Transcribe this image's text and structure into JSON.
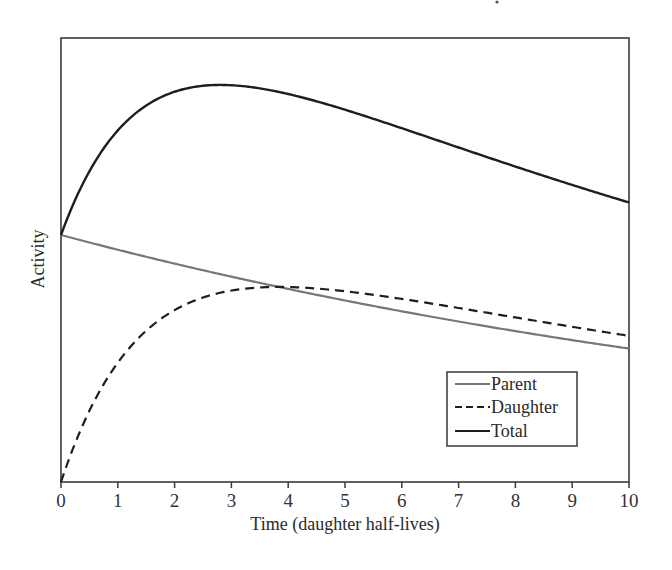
{
  "chart_data": {
    "type": "line",
    "title": "",
    "xlabel": "Time (daughter half-lives)",
    "ylabel": "Activity",
    "x": [
      0,
      1,
      2,
      3,
      4,
      5,
      6,
      7,
      8,
      9,
      10
    ],
    "xticks": [
      "0",
      "1",
      "2",
      "3",
      "4",
      "5",
      "6",
      "7",
      "8",
      "9",
      "10"
    ],
    "xlim": [
      0,
      10
    ],
    "ylim": [
      0,
      1.8
    ],
    "yticks": [],
    "grid": false,
    "legend_position": "lower right (inside)",
    "series": [
      {
        "name": "Parent",
        "style": "solid",
        "color": "#777777",
        "values": [
          1.0,
          0.94,
          0.884,
          0.831,
          0.782,
          0.735,
          0.691,
          0.65,
          0.611,
          0.574,
          0.54
        ]
      },
      {
        "name": "Daughter",
        "style": "dashed",
        "color": "#1e1e1e",
        "values": [
          0.0,
          0.483,
          0.696,
          0.775,
          0.79,
          0.773,
          0.742,
          0.705,
          0.667,
          0.63,
          0.593
        ]
      },
      {
        "name": "Total",
        "style": "solid",
        "color": "#1e1e1e",
        "values": [
          1.0,
          1.423,
          1.58,
          1.606,
          1.572,
          1.508,
          1.433,
          1.355,
          1.278,
          1.204,
          1.133
        ]
      }
    ],
    "annotations": [
      {
        "text": "Daughter activity crosses parent activity",
        "x": 3.7
      },
      {
        "text": "Total activity maximum",
        "x": 2.7
      }
    ],
    "model": {
      "parent_decay_const": 0.0616,
      "daughter_decay_const": 0.6931
    }
  },
  "legend": {
    "items": [
      {
        "label": "Parent",
        "style": "solid-gray"
      },
      {
        "label": "Daughter",
        "style": "dashed"
      },
      {
        "label": "Total",
        "style": "solid-dark"
      }
    ]
  }
}
